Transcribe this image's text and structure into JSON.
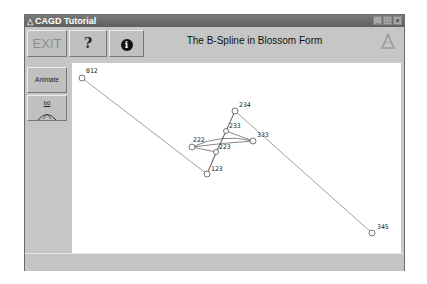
{
  "window": {
    "title": "CAGD Tutorial",
    "controls": [
      "minimize-icon",
      "maximize-icon",
      "close-icon"
    ]
  },
  "toolbar": {
    "exit_label": "EXIT",
    "help_label": "?",
    "info_label": "i",
    "heading": "The B-Spline in Blossom Form",
    "logo_icon": "cagd-logo-icon"
  },
  "sidebar": {
    "animate_label": "Animate",
    "b0_label": "b0"
  },
  "canvas": {
    "points": [
      {
        "label": "012",
        "x": 10,
        "y": 15
      },
      {
        "label": "123",
        "x": 135,
        "y": 111
      },
      {
        "label": "223",
        "x": 144,
        "y": 89
      },
      {
        "label": "222",
        "x": 120,
        "y": 84
      },
      {
        "label": "233",
        "x": 154,
        "y": 68
      },
      {
        "label": "333",
        "x": 181,
        "y": 78
      },
      {
        "label": "234",
        "x": 163,
        "y": 48
      },
      {
        "label": "345",
        "x": 300,
        "y": 170
      }
    ],
    "control_polygon": [
      "012",
      "123",
      "234",
      "345"
    ]
  },
  "statusbar": {
    "text": ""
  }
}
